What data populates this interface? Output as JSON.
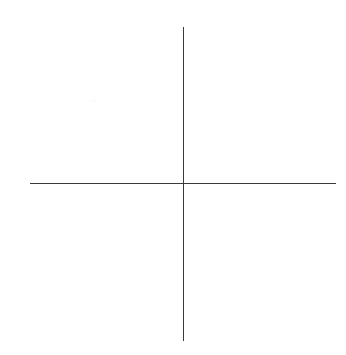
{
  "diagram": {
    "type": "cartesian-axes-cross",
    "background_color": "#ffffff",
    "line_color": "#3a3a3a",
    "horizontal_axis": {
      "x1": 30,
      "x2": 336,
      "y": 183
    },
    "vertical_axis": {
      "x": 183,
      "y1": 27,
      "y2": 341
    },
    "intersection": {
      "x": 183,
      "y": 183
    },
    "labels": []
  }
}
